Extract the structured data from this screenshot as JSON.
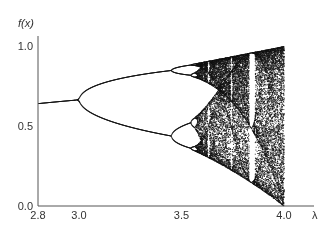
{
  "chart_data": {
    "type": "scatter",
    "title": "",
    "subtitle": "Bifurcation diagram of the logistic map",
    "xlabel": "λ",
    "ylabel": "f(x)",
    "xlim": [
      2.8,
      4.0
    ],
    "ylim": [
      0.0,
      1.0
    ],
    "grid": false,
    "legend": "none",
    "x_ticks": [
      {
        "value": 2.8,
        "label": "2.8"
      },
      {
        "value": 3.0,
        "label": "3.0"
      },
      {
        "value": 3.5,
        "label": "3.5"
      },
      {
        "value": 4.0,
        "label": "4.0"
      }
    ],
    "y_ticks": [
      {
        "value": 0.0,
        "label": "0.0"
      },
      {
        "value": 0.5,
        "label": "0.5"
      },
      {
        "value": 1.0,
        "label": "1.0"
      }
    ],
    "model": {
      "equation": "x(n+1) = λ x(n) (1 - x(n))",
      "x0": 0.5,
      "transient_iterations": 300,
      "plotted_iterations": 60,
      "lambda_step": 0.0015
    },
    "features": [
      {
        "name": "fixed-point",
        "lambda_range": [
          2.8,
          3.0
        ],
        "value_at_2.8": 0.643
      },
      {
        "name": "period-2 bifurcation",
        "lambda": 3.0
      },
      {
        "name": "period-4 bifurcation",
        "lambda": 3.449
      },
      {
        "name": "onset of chaos",
        "lambda": 3.57
      },
      {
        "name": "period-3 window",
        "lambda": 3.83
      },
      {
        "name": "full range at",
        "lambda": 4.0,
        "range": [
          0.0,
          1.0
        ]
      }
    ],
    "series": [
      {
        "name": "attractor",
        "color": "#111111"
      }
    ],
    "colors": {
      "axis": "#555555",
      "points": "#111111",
      "background": "#ffffff"
    }
  }
}
